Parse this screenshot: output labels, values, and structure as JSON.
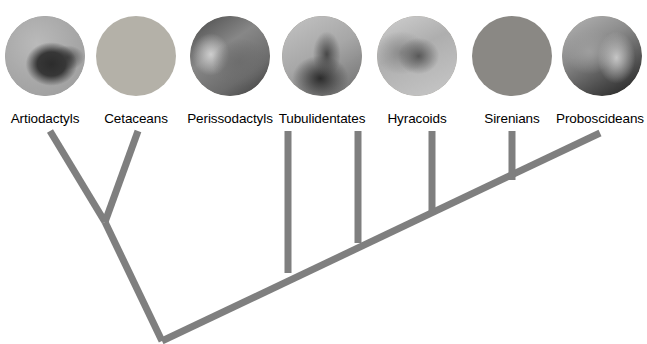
{
  "figure": {
    "name": "afrotheria-laurasiatheria-cladogram",
    "width": 647,
    "height": 344,
    "background_color": "#ffffff",
    "branch_color": "#7f7f7f",
    "branch_width": 7
  },
  "taxa": [
    {
      "id": "artiodactyls",
      "label": "Artiodactyls",
      "photo_subject": "camel-head-photo",
      "photo_tone": "#a3a3a3",
      "photo_cx": 45,
      "photo_cy": 56,
      "photo_r": 40,
      "label_x": 45,
      "label_y": 112,
      "tip_x": 50,
      "tip_y": 131
    },
    {
      "id": "cetaceans",
      "label": "Cetaceans",
      "photo_subject": "dolphin-head-photo",
      "photo_tone": "#b4b1a8",
      "photo_cx": 136,
      "photo_cy": 56,
      "photo_r": 40,
      "label_x": 136,
      "label_y": 112,
      "tip_x": 138,
      "tip_y": 131
    },
    {
      "id": "perissodactyls",
      "label": "Perissodactyls",
      "photo_subject": "rhinoceros-photo",
      "photo_tone": "#8f8d88",
      "photo_cx": 230,
      "photo_cy": 56,
      "photo_r": 40,
      "label_x": 230,
      "label_y": 112,
      "tip_x": 288,
      "tip_y": 131
    },
    {
      "id": "tubulidentates",
      "label": "Tubulidentates",
      "photo_subject": "aardvark-photo",
      "photo_tone": "#9d9a93",
      "photo_cx": 322,
      "photo_cy": 56,
      "photo_r": 40,
      "label_x": 322,
      "label_y": 112,
      "tip_x": 358,
      "tip_y": 131
    },
    {
      "id": "hyracoids",
      "label": "Hyracoids",
      "photo_subject": "hyrax-photo",
      "photo_tone": "#a8a49c",
      "photo_cx": 417,
      "photo_cy": 56,
      "photo_r": 40,
      "label_x": 417,
      "label_y": 112,
      "tip_x": 432,
      "tip_y": 131
    },
    {
      "id": "sirenians",
      "label": "Sirenians",
      "photo_subject": "manatee-photo",
      "photo_tone": "#8a8884",
      "photo_cx": 512,
      "photo_cy": 56,
      "photo_r": 40,
      "label_x": 512,
      "label_y": 112,
      "tip_x": 512,
      "tip_y": 131
    },
    {
      "id": "proboscideans",
      "label": "Proboscideans",
      "photo_subject": "elephant-photo",
      "photo_tone": "#a5a29a",
      "photo_cx": 602,
      "photo_cy": 56,
      "photo_r": 40,
      "label_x": 600,
      "label_y": 112,
      "tip_x": 600,
      "tip_y": 133
    }
  ],
  "tree": {
    "root": {
      "x": 162,
      "y": 341
    },
    "spine": {
      "x1": 162,
      "y1": 341,
      "x2": 600,
      "y2": 133
    },
    "clade_node": {
      "id": "cetartiodactyla-node",
      "x": 105,
      "y": 222
    },
    "branches": [
      {
        "id": "branch-artiodactyls",
        "x1": 50,
        "y1": 131,
        "x2": 105,
        "y2": 222
      },
      {
        "id": "branch-cetaceans",
        "x1": 138,
        "y1": 131,
        "x2": 105,
        "y2": 222
      },
      {
        "id": "branch-cetartiodactyla-stem",
        "x1": 105,
        "y1": 222,
        "x2": 162,
        "y2": 341
      },
      {
        "id": "branch-perissodactyls",
        "x1": 288,
        "y1": 131,
        "x2": 288,
        "y2": 273
      },
      {
        "id": "branch-tubulidentates",
        "x1": 358,
        "y1": 131,
        "x2": 358,
        "y2": 243
      },
      {
        "id": "branch-hyracoids",
        "x1": 432,
        "y1": 131,
        "x2": 432,
        "y2": 212
      },
      {
        "id": "branch-sirenians",
        "x1": 512,
        "y1": 131,
        "x2": 512,
        "y2": 180
      }
    ]
  }
}
